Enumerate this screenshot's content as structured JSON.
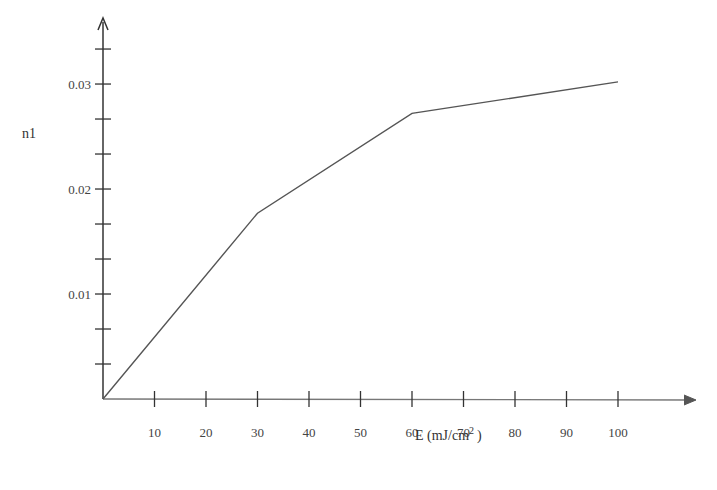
{
  "chart_data": {
    "type": "line",
    "title": "",
    "xlabel": "E (mJ/cm²)",
    "xlabel_base": "E (mJ/cm",
    "xlabel_sup": "2",
    "xlabel_close": ")",
    "ylabel": "n1",
    "x": [
      0,
      30,
      60,
      100
    ],
    "series": [
      {
        "name": "n1",
        "values": [
          0,
          0.0177,
          0.0272,
          0.0302
        ]
      }
    ],
    "x_ticks": [
      10,
      20,
      30,
      40,
      50,
      60,
      70,
      80,
      90,
      100
    ],
    "x_tick_labels": [
      "10",
      "20",
      "30",
      "40",
      "50",
      "60",
      "70",
      "80",
      "90",
      "100"
    ],
    "y_major_ticks": [
      0.01,
      0.02,
      0.03
    ],
    "y_tick_labels": [
      "0.01",
      "0.02",
      "0.03"
    ],
    "y_minor_step": 0.003333,
    "xlim": [
      0,
      110
    ],
    "ylim": [
      0,
      0.036
    ],
    "grid": false,
    "legend": "none",
    "colors": {
      "axis": "#333333",
      "line": "#555555",
      "xaxis": "#888888"
    }
  }
}
